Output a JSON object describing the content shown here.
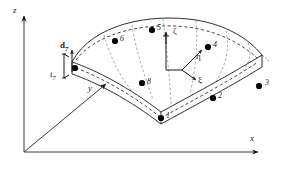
{
  "figure": {
    "type": "degenerated-shell-finite-element"
  },
  "global_axes": [
    {
      "name": "z-axis",
      "label": "z",
      "direction": "up"
    },
    {
      "name": "x-axis",
      "label": "x",
      "direction": "right"
    },
    {
      "name": "y-axis",
      "label": "y",
      "direction": "diagonal-up-right"
    }
  ],
  "natural_axes": [
    {
      "name": "zeta-axis",
      "label": "ζ",
      "direction": "up"
    },
    {
      "name": "eta-axis",
      "label": "η",
      "direction": "up-right"
    },
    {
      "name": "xi-axis",
      "label": "ξ",
      "direction": "down-right"
    }
  ],
  "nodes": [
    {
      "id": "1",
      "label": "1"
    },
    {
      "id": "2",
      "label": "2"
    },
    {
      "id": "3",
      "label": "3"
    },
    {
      "id": "4",
      "label": "4"
    },
    {
      "id": "5",
      "label": "5"
    },
    {
      "id": "6",
      "label": "6"
    },
    {
      "id": "7",
      "label": "7"
    },
    {
      "id": "8",
      "label": "8"
    }
  ],
  "annotations": {
    "director_vector": {
      "symbol": "d",
      "subscript": "7"
    },
    "thickness": {
      "symbol": "t",
      "subscript": "7"
    }
  },
  "colors": {
    "line": "#1a1a1a",
    "dashed": "#1a1a1a",
    "node_fill": "#000000",
    "background": "#ffffff"
  }
}
